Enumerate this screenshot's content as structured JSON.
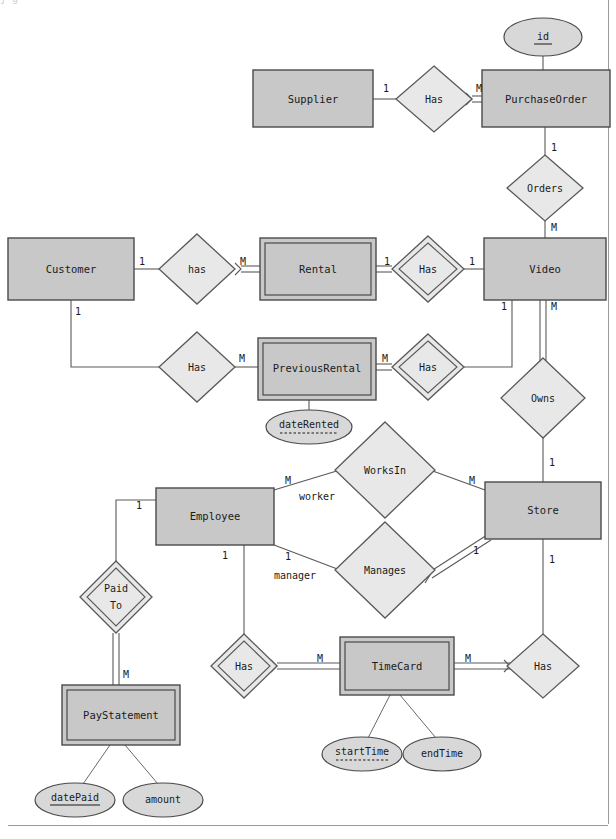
{
  "diagram": {
    "type": "entity-relationship-diagram",
    "notation": "chen",
    "title_cropped": "j       g",
    "colors": {
      "entity_fill": "#c8c8c8",
      "relationship_fill": "#e8e8e8",
      "attribute_fill": "#d8d8d8",
      "stroke": "#4a4a4a",
      "background": "#ffffff",
      "page_border": "#9a9a9a"
    }
  },
  "entities": [
    {
      "id": "supplier",
      "label": "Supplier",
      "weak": false,
      "x": 253,
      "y": 70,
      "w": 120,
      "h": 57
    },
    {
      "id": "purchaseorder",
      "label": "PurchaseOrder",
      "weak": false,
      "x": 482,
      "y": 70,
      "w": 128,
      "h": 57
    },
    {
      "id": "customer",
      "label": "Customer",
      "weak": false,
      "x": 8,
      "y": 238,
      "w": 126,
      "h": 62
    },
    {
      "id": "rental",
      "label": "Rental",
      "weak": true,
      "x": 260,
      "y": 238,
      "w": 116,
      "h": 62
    },
    {
      "id": "video",
      "label": "Video",
      "weak": false,
      "x": 484,
      "y": 238,
      "w": 122,
      "h": 62
    },
    {
      "id": "previousrental",
      "label": "PreviousRental",
      "weak": true,
      "x": 258,
      "y": 338,
      "w": 118,
      "h": 62
    },
    {
      "id": "employee",
      "label": "Employee",
      "weak": false,
      "x": 156,
      "y": 488,
      "w": 118,
      "h": 57
    },
    {
      "id": "store",
      "label": "Store",
      "weak": false,
      "x": 485,
      "y": 482,
      "w": 116,
      "h": 57
    },
    {
      "id": "paystatement",
      "label": "PayStatement",
      "weak": true,
      "x": 62,
      "y": 685,
      "w": 118,
      "h": 60
    },
    {
      "id": "timecard",
      "label": "TimeCard",
      "weak": true,
      "x": 340,
      "y": 637,
      "w": 114,
      "h": 58
    }
  ],
  "relationships": [
    {
      "id": "has-supplier-po",
      "label": "Has",
      "identifying": false,
      "cx": 434,
      "cy": 99,
      "rx": 38,
      "ry": 33
    },
    {
      "id": "orders-po-video",
      "label": "Orders",
      "identifying": false,
      "cx": 545,
      "cy": 188,
      "rx": 38,
      "ry": 33
    },
    {
      "id": "has-customer-rental",
      "label": "has",
      "identifying": false,
      "cx": 197,
      "cy": 269,
      "rx": 38,
      "ry": 35
    },
    {
      "id": "has-rental-video",
      "label": "Has",
      "identifying": true,
      "cx": 428,
      "cy": 269,
      "rx": 36,
      "ry": 33
    },
    {
      "id": "has-customer-prevrental",
      "label": "Has",
      "identifying": false,
      "cx": 197,
      "cy": 367,
      "rx": 38,
      "ry": 35
    },
    {
      "id": "has-prevrental-video",
      "label": "Has",
      "identifying": true,
      "cx": 428,
      "cy": 367,
      "rx": 36,
      "ry": 33
    },
    {
      "id": "owns-video-store",
      "label": "Owns",
      "identifying": false,
      "cx": 543,
      "cy": 398,
      "rx": 42,
      "ry": 40
    },
    {
      "id": "worksin",
      "label": "WorksIn",
      "identifying": false,
      "cx": 385,
      "cy": 470,
      "rx": 50,
      "ry": 48
    },
    {
      "id": "manages",
      "label": "Manages",
      "identifying": false,
      "cx": 385,
      "cy": 570,
      "rx": 50,
      "ry": 48
    },
    {
      "id": "paid-to",
      "label": "Paid\nTo",
      "label_line1": "Paid",
      "label_line2": "To",
      "identifying": true,
      "cx": 116,
      "cy": 597,
      "rx": 36,
      "ry": 36
    },
    {
      "id": "has-employee-timecard",
      "label": "Has",
      "identifying": true,
      "cx": 244,
      "cy": 667,
      "rx": 33,
      "ry": 33
    },
    {
      "id": "has-store-timecard",
      "label": "Has",
      "identifying": false,
      "cx": 543,
      "cy": 667,
      "rx": 36,
      "ry": 33
    }
  ],
  "attributes": [
    {
      "id": "id",
      "label": "id",
      "key": "primary",
      "underline": "solid",
      "cx": 543,
      "cy": 37,
      "rx": 39,
      "ry": 19
    },
    {
      "id": "daterented",
      "label": "dateRented",
      "key": "partial",
      "underline": "dashed",
      "cx": 309,
      "cy": 427,
      "rx": 43,
      "ry": 17
    },
    {
      "id": "starttime",
      "label": "startTime",
      "key": "partial",
      "underline": "dashed",
      "cx": 362,
      "cy": 754,
      "rx": 40,
      "ry": 17
    },
    {
      "id": "endtime",
      "label": "endTime",
      "key": "none",
      "underline": "none",
      "cx": 442,
      "cy": 754,
      "rx": 39,
      "ry": 17
    },
    {
      "id": "datepaid",
      "label": "datePaid",
      "key": "primary",
      "underline": "solid",
      "cx": 75,
      "cy": 800,
      "rx": 40,
      "ry": 17
    },
    {
      "id": "amount",
      "label": "amount",
      "key": "none",
      "underline": "none",
      "cx": 163,
      "cy": 800,
      "rx": 40,
      "ry": 17
    }
  ],
  "cardinality_labels": [
    {
      "id": "card-supplier-has",
      "text": "1",
      "x": 386,
      "y": 89
    },
    {
      "id": "card-has-po",
      "text": "M",
      "x": 479,
      "y": 89
    },
    {
      "id": "card-po-orders",
      "text": "1",
      "x": 554,
      "y": 148
    },
    {
      "id": "card-orders-video",
      "text": "M",
      "x": 554,
      "y": 228
    },
    {
      "id": "card-customer-has",
      "text": "1",
      "x": 142,
      "y": 262
    },
    {
      "id": "card-has-rental",
      "text": "M",
      "x": 243,
      "y": 262
    },
    {
      "id": "card-rental-has",
      "text": "1",
      "x": 387,
      "y": 262
    },
    {
      "id": "card-has-video",
      "text": "1",
      "x": 472,
      "y": 262
    },
    {
      "id": "card-customer-has2",
      "text": "1",
      "x": 78,
      "y": 312
    },
    {
      "id": "card-has2-prevrental",
      "text": "M",
      "x": 242,
      "y": 359
    },
    {
      "id": "card-prevrental-has",
      "text": "M",
      "x": 385,
      "y": 359
    },
    {
      "id": "card-video-owns",
      "text": "1",
      "x": 504,
      "y": 307
    },
    {
      "id": "card-video-owns2",
      "text": "M",
      "x": 554,
      "y": 307
    },
    {
      "id": "card-owns-store",
      "text": "1",
      "x": 552,
      "y": 463
    },
    {
      "id": "card-employee-worksin",
      "text": "M",
      "x": 288,
      "y": 481
    },
    {
      "id": "card-worksin-store",
      "text": "M",
      "x": 472,
      "y": 481
    },
    {
      "id": "card-employee-manages",
      "text": "1",
      "x": 288,
      "y": 557
    },
    {
      "id": "card-manages-store",
      "text": "1",
      "x": 476,
      "y": 551
    },
    {
      "id": "card-employee-paidto",
      "text": "1",
      "x": 139,
      "y": 506
    },
    {
      "id": "card-paidto-paystmt",
      "text": "M",
      "x": 126,
      "y": 675
    },
    {
      "id": "card-employee-has",
      "text": "1",
      "x": 225,
      "y": 556
    },
    {
      "id": "card-has-timecard",
      "text": "M",
      "x": 320,
      "y": 659
    },
    {
      "id": "card-timecard-has",
      "text": "M",
      "x": 468,
      "y": 659
    },
    {
      "id": "card-store-has",
      "text": "1",
      "x": 552,
      "y": 560
    }
  ],
  "role_labels": [
    {
      "id": "role-worker",
      "text": "worker",
      "x": 317,
      "y": 497
    },
    {
      "id": "role-manager",
      "text": "manager",
      "x": 295,
      "y": 576
    }
  ]
}
